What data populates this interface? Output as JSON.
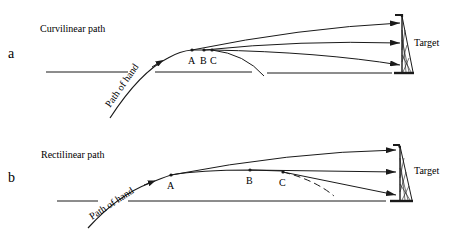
{
  "panels": [
    {
      "letter": "a",
      "title": "Curvilinear path",
      "hand_label": "Path of hand",
      "points": [
        "A",
        "B",
        "C"
      ],
      "target_label": "Target"
    },
    {
      "letter": "b",
      "title": "Rectilinear path",
      "hand_label": "Path of hand",
      "points": [
        "A",
        "B",
        "C"
      ],
      "target_label": "Target"
    }
  ],
  "colors": {
    "ink": "#1a1a1a",
    "background": "#ffffff"
  }
}
